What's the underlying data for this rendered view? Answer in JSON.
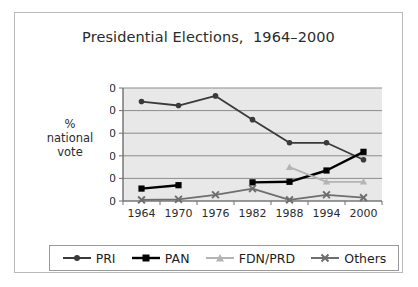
{
  "chart_data": {
    "type": "line",
    "title": "Presidential Elections,  1964–2000",
    "xlabel": "",
    "ylabel": "%\nnational\nvote",
    "ylabel_lines": [
      "%",
      "national",
      "vote"
    ],
    "categories": [
      "1964",
      "1970",
      "1976",
      "1982",
      "1988",
      "1994",
      "2000"
    ],
    "ylim": [
      0,
      100
    ],
    "yticks": [
      "0",
      "20",
      "40",
      "60",
      "80",
      "100"
    ],
    "ytick_values": [
      0,
      20,
      40,
      60,
      80,
      100
    ],
    "grid": true,
    "legend_position": "bottom",
    "series": [
      {
        "name": "PRI",
        "color": "#3a3a3a",
        "marker": "circle",
        "values": [
          88,
          84.5,
          93,
          72,
          51.5,
          51.5,
          36.5
        ]
      },
      {
        "name": "PAN",
        "color": "#000000",
        "marker": "square",
        "values": [
          11,
          14,
          null,
          16.5,
          17,
          27,
          43.5
        ]
      },
      {
        "name": "FDN/PRD",
        "color": "#b4b4b4",
        "marker": "triangle",
        "values": [
          null,
          null,
          null,
          null,
          30,
          17,
          17
        ]
      },
      {
        "name": "Others",
        "color": "#6e6e6e",
        "marker": "x",
        "values": [
          1,
          1.5,
          5.5,
          11,
          1,
          5.5,
          3
        ]
      }
    ]
  },
  "colors": {
    "plot_background": "#e8e8e8",
    "gridline": "#8c8c8c",
    "axis": "#6f6f6f",
    "frame_border": "#b9b9b9",
    "legend_border": "#9a9a9a",
    "text": "#2b2b2b"
  },
  "legend": {
    "items": [
      {
        "label": "PRI"
      },
      {
        "label": "PAN"
      },
      {
        "label": "FDN/PRD"
      },
      {
        "label": "Others"
      }
    ]
  }
}
